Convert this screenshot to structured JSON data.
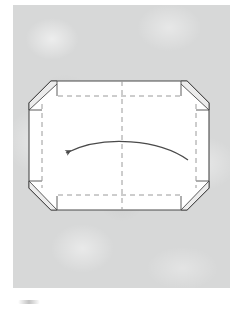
{
  "figure": {
    "panel_background_color": "#d7d8d8",
    "paper_fill_color": "#ffffff",
    "line_color": "#4a4a4a",
    "crease_color": "#9a9a9a",
    "flap_shade_color": "#e8e8e8",
    "caption_mark_label": "partial figure caption mark",
    "arrow": {
      "label": "fold-left-arrow",
      "direction": "left",
      "style": "curved",
      "color": "#4a4a4a",
      "start_x": 188,
      "start_y": 158,
      "end_x": 66,
      "end_y": 153
    },
    "paper_shape": {
      "label": "octagonal folded paper",
      "left": 29,
      "top": 81,
      "right": 209,
      "bottom": 210,
      "bevel": 22
    },
    "creases": [
      {
        "label": "center-vertical-crease",
        "orientation": "vertical",
        "x": 122
      },
      {
        "label": "left-vertical-crease",
        "orientation": "vertical",
        "x": 42
      },
      {
        "label": "right-vertical-crease",
        "orientation": "vertical",
        "x": 196
      },
      {
        "label": "top-horizontal-crease",
        "orientation": "horizontal",
        "y": 96
      },
      {
        "label": "bottom-horizontal-crease",
        "orientation": "horizontal",
        "y": 195
      }
    ],
    "corner_flaps": [
      {
        "label": "top-left-corner-flap"
      },
      {
        "label": "top-right-corner-flap"
      },
      {
        "label": "bottom-left-corner-flap"
      },
      {
        "label": "bottom-right-corner-flap"
      }
    ]
  }
}
